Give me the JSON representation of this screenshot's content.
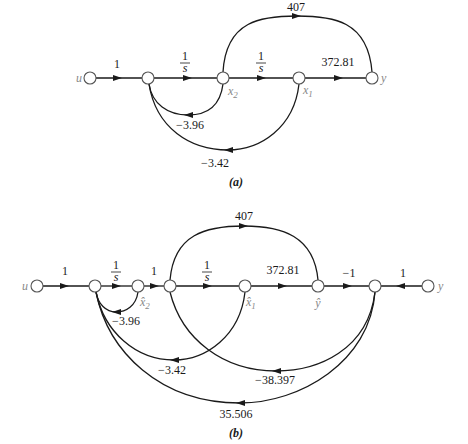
{
  "diagram_a": {
    "caption": "(a)",
    "nodes": {
      "input": "u",
      "x2": "x2",
      "x1": "x1",
      "output": "y"
    },
    "gains": {
      "u_to_n1": "1",
      "n1_to_x2_num": "1",
      "n1_to_x2_den": "s",
      "x2_to_x1_num": "1",
      "x2_to_x1_den": "s",
      "x1_to_y": "372.81",
      "x2_to_y": "407",
      "x2_to_n1_feedback": "−3.96",
      "x1_to_n1_feedback": "−3.42"
    }
  },
  "diagram_b": {
    "caption": "(b)",
    "nodes": {
      "input": "u",
      "x2hat": "x̂2",
      "x1hat": "x̂1",
      "yhat": "ŷ",
      "output": "y"
    },
    "gains": {
      "u_to_n1": "1",
      "n1_to_x2hat_num": "1",
      "n1_to_x2hat_den": "s",
      "x2hat_to_n3": "1",
      "n3_to_x1hat_num": "1",
      "n3_to_x1hat_den": "s",
      "x1hat_to_yhat": "372.81",
      "n3_to_yhat": "407",
      "yhat_to_n5": "−1",
      "y_to_n5": "1",
      "x2hat_to_n1_feedback": "−3.96",
      "x1hat_to_n1_feedback": "−3.42",
      "n5_to_n3_feedback": "−38.397",
      "n5_to_n1_feedback": "35.506"
    }
  }
}
